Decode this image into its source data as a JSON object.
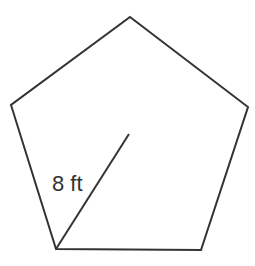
{
  "diagram": {
    "shape": "regular-pentagon",
    "stroke_color": "#333333",
    "background": "#ffffff",
    "vertices": [
      [
        130,
        17
      ],
      [
        248,
        107
      ],
      [
        201,
        250
      ],
      [
        56,
        249
      ],
      [
        11,
        105
      ]
    ],
    "center": [
      129,
      134
    ],
    "radius_segment": {
      "from": [
        129,
        134
      ],
      "to": [
        56,
        249
      ]
    },
    "label": {
      "text": "8 ft",
      "x": 52,
      "y": 191
    }
  }
}
